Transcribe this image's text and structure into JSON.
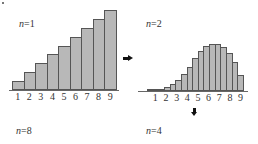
{
  "chart_data": [
    {
      "type": "bar",
      "title": "n=1",
      "categories": [
        "1",
        "2",
        "3",
        "4",
        "5",
        "6",
        "7",
        "8",
        "9"
      ],
      "values": [
        1,
        2,
        3,
        4,
        5,
        6,
        7,
        8,
        9
      ],
      "xlabel": "",
      "ylabel": "",
      "tick_labels": [
        "1",
        "2",
        "3",
        "4",
        "5",
        "6",
        "7",
        "8",
        "9"
      ],
      "grid": false
    },
    {
      "type": "bar",
      "title": "n=2",
      "categories": [
        "1",
        "1.5",
        "2",
        "2.5",
        "3",
        "3.5",
        "4",
        "4.5",
        "5",
        "5.5",
        "6",
        "6.5",
        "7",
        "7.5",
        "8",
        "8.5",
        "9"
      ],
      "values": [
        1,
        4,
        10,
        20,
        35,
        56,
        84,
        120,
        165,
        200,
        224,
        236,
        235,
        220,
        190,
        144,
        81
      ],
      "xlabel": "",
      "ylabel": "",
      "tick_labels": [
        "1",
        "2",
        "3",
        "4",
        "5",
        "6",
        "7",
        "8",
        "9"
      ],
      "grid": false
    }
  ],
  "labels": {
    "n1": {
      "var": "n",
      "eq": "=1"
    },
    "n2": {
      "var": "n",
      "eq": "=2"
    },
    "n8": {
      "var": "n",
      "eq": "=8"
    },
    "n4": {
      "var": "n",
      "eq": "=4"
    }
  },
  "colors": {
    "bar_fill": "#b8b8b8",
    "bar_edge": "#555555"
  }
}
